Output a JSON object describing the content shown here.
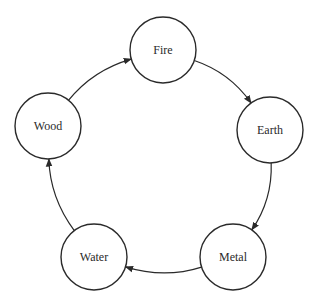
{
  "nodes": [
    {
      "id": "fire",
      "label": "Fire"
    },
    {
      "id": "earth",
      "label": "Earth"
    },
    {
      "id": "metal",
      "label": "Metal"
    },
    {
      "id": "water",
      "label": "Water"
    },
    {
      "id": "wood",
      "label": "Wood"
    }
  ],
  "edges": [
    {
      "from": "wood",
      "to": "fire"
    },
    {
      "from": "fire",
      "to": "earth"
    },
    {
      "from": "earth",
      "to": "metal"
    },
    {
      "from": "metal",
      "to": "water"
    },
    {
      "from": "water",
      "to": "wood"
    }
  ],
  "colors": {
    "stroke": "#2a2a2a",
    "background": "#ffffff"
  }
}
